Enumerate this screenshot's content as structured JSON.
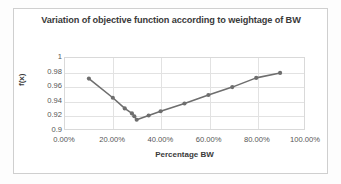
{
  "chart_data": {
    "type": "line",
    "title": "Variation of objective function according to weightage of BW",
    "xlabel": "Percentage BW",
    "ylabel": "f(x)",
    "xlim": [
      0,
      100
    ],
    "ylim": [
      0.9,
      1
    ],
    "grid": true,
    "legend": "none",
    "marker": "circle",
    "series_color": "#6e6e6e",
    "x_tick_labels": [
      "0.00%",
      "20.00%",
      "40.00%",
      "60.00%",
      "80.00%",
      "100.00%"
    ],
    "x_ticks": [
      0,
      20,
      40,
      60,
      80,
      100
    ],
    "y_tick_labels": [
      "1",
      "0.98",
      "0.96",
      "0.94",
      "0.92",
      "0.9"
    ],
    "y_ticks": [
      1,
      0.98,
      0.96,
      0.94,
      0.92,
      0.9
    ],
    "x": [
      10,
      20,
      25,
      28,
      29,
      30,
      35,
      40,
      50,
      60,
      70,
      80,
      90
    ],
    "values": [
      0.971,
      0.944,
      0.929,
      0.922,
      0.918,
      0.913,
      0.919,
      0.925,
      0.936,
      0.948,
      0.959,
      0.972,
      0.979
    ],
    "series": [
      {
        "name": "f(x)",
        "x": [
          10,
          20,
          25,
          28,
          29,
          30,
          35,
          40,
          50,
          60,
          70,
          80,
          90
        ],
        "values": [
          0.971,
          0.944,
          0.929,
          0.922,
          0.918,
          0.913,
          0.919,
          0.925,
          0.936,
          0.948,
          0.959,
          0.972,
          0.979
        ]
      }
    ]
  },
  "colors": {
    "series": "#6e6e6e",
    "grid": "#e2e2e2",
    "frame": "#cfcfcf",
    "text": "#3a3a3a"
  }
}
